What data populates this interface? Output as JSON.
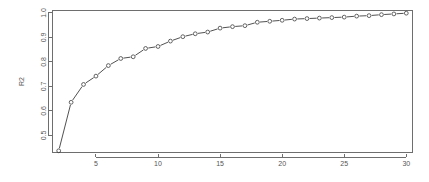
{
  "chart_data": {
    "type": "line",
    "title": "",
    "subtitle": "",
    "xlabel": "",
    "ylabel": "R2",
    "xlim": [
      1.5,
      30.5
    ],
    "ylim": [
      0.43,
      1.01
    ],
    "grid": false,
    "legend": null,
    "marker": "open-circle",
    "line_style": "solid-thin",
    "x": [
      2,
      3,
      4,
      5,
      6,
      7,
      8,
      9,
      10,
      11,
      12,
      13,
      14,
      15,
      16,
      17,
      18,
      19,
      20,
      21,
      22,
      23,
      24,
      25,
      26,
      27,
      28,
      29,
      30
    ],
    "y": [
      0.437,
      0.635,
      0.708,
      0.742,
      0.785,
      0.814,
      0.821,
      0.855,
      0.863,
      0.885,
      0.903,
      0.915,
      0.922,
      0.938,
      0.944,
      0.948,
      0.962,
      0.966,
      0.97,
      0.975,
      0.977,
      0.979,
      0.981,
      0.983,
      0.987,
      0.989,
      0.993,
      0.996,
      0.999
    ],
    "series": [
      {
        "name": "R2",
        "values": [
          0.437,
          0.635,
          0.708,
          0.742,
          0.785,
          0.814,
          0.821,
          0.855,
          0.863,
          0.885,
          0.903,
          0.915,
          0.922,
          0.938,
          0.944,
          0.948,
          0.962,
          0.966,
          0.97,
          0.975,
          0.977,
          0.979,
          0.981,
          0.983,
          0.987,
          0.989,
          0.993,
          0.996,
          0.999
        ]
      }
    ],
    "x_ticks": [
      5,
      10,
      15,
      20,
      25,
      30
    ],
    "x_tick_labels": [
      "5",
      "10",
      "15",
      "20",
      "25",
      "30"
    ],
    "y_ticks": [
      0.5,
      0.6,
      0.7,
      0.8,
      0.9,
      1.0
    ],
    "y_tick_labels": [
      "0.5",
      "0.6",
      "0.7",
      "0.8",
      "0.9",
      "1.0"
    ],
    "colors": {
      "line": "#3d3d3d",
      "marker": "#3d3d3d",
      "axis": "#6e6e6e",
      "text": "#555555",
      "background": "#ffffff"
    }
  }
}
